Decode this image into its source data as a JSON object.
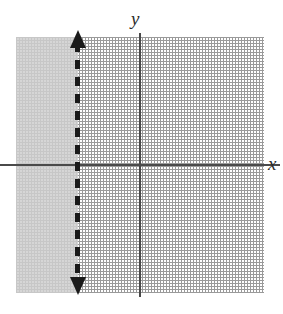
{
  "figure": {
    "type": "cartesian-coordinate-plane",
    "axis_labels": {
      "x": "x",
      "y": "y"
    },
    "colors": {
      "grid": "#9a9a9a",
      "axis": "#4a4a4a",
      "boundary_line": "#1a1a1a",
      "shading": "#cfcfcf",
      "background": "#ffffff"
    }
  },
  "chart_data": {
    "type": "line",
    "title": "",
    "xlabel": "x",
    "ylabel": "y",
    "xlim": [
      -4,
      4
    ],
    "ylim": [
      -4,
      4
    ],
    "grid": true,
    "grid_style": "dotted",
    "grid_spacing": 1,
    "legend": "none",
    "series": [
      {
        "name": "boundary line x = -2",
        "equation": "x = -2",
        "line_style": "dashed",
        "arrows": [
          "up",
          "down"
        ],
        "orientation": "vertical",
        "x": [
          -2,
          -2
        ],
        "y": [
          -4,
          4
        ]
      }
    ],
    "shaded_regions": [
      {
        "name": "solution region",
        "inequality": "x < -2",
        "x_range": [
          -4,
          -2
        ],
        "y_range": [
          -4,
          4
        ],
        "fill": "#cfcfcf",
        "side": "left"
      }
    ],
    "annotations": [
      {
        "text": "y",
        "position": "top of vertical axis",
        "style": "italic"
      },
      {
        "text": "x",
        "position": "right of horizontal axis",
        "style": "italic"
      }
    ]
  }
}
